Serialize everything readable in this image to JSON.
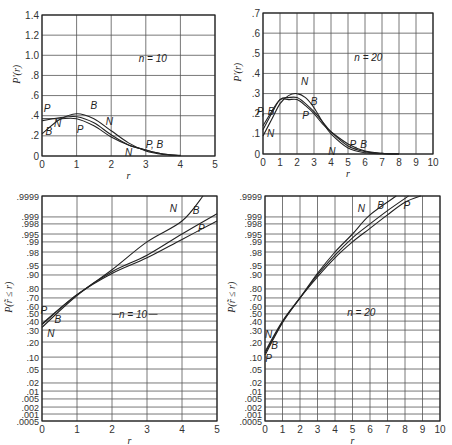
{
  "chart_data": [
    {
      "id": "pdf_n10",
      "type": "line",
      "title": "",
      "annotation": "n = 10",
      "xlabel": "r",
      "ylabel": "P'(r)",
      "xlim": [
        0,
        5
      ],
      "ylim": [
        0,
        1.4
      ],
      "xticks": [
        "0",
        "1",
        "2",
        "3",
        "4",
        "5"
      ],
      "yticks": [
        "0",
        ".2",
        ".4",
        ".6",
        ".8",
        "1.0",
        "1.2",
        "1.4"
      ],
      "grid": true,
      "frame": {
        "x0": 42,
        "x1": 215,
        "y0": 15,
        "y1": 156
      },
      "series": [
        {
          "name": "N",
          "x": [
            0,
            0.5,
            1.0,
            1.5,
            2.0,
            2.5,
            3.0,
            3.5,
            4.0
          ],
          "y": [
            0.22,
            0.36,
            0.42,
            0.37,
            0.25,
            0.13,
            0.05,
            0.015,
            0.003
          ]
        },
        {
          "name": "B",
          "x": [
            0,
            0.5,
            1.0,
            1.5,
            2.0,
            2.5,
            3.0,
            3.5,
            4.0
          ],
          "y": [
            0.35,
            0.38,
            0.39,
            0.33,
            0.21,
            0.11,
            0.06,
            0.02,
            0.005
          ]
        },
        {
          "name": "P",
          "x": [
            0,
            0.5,
            1.0,
            1.5,
            2.0,
            2.5,
            3.0,
            3.5,
            4.0
          ],
          "y": [
            0.37,
            0.37,
            0.37,
            0.3,
            0.19,
            0.11,
            0.06,
            0.02,
            0.006
          ]
        }
      ],
      "labels": [
        {
          "text": "P",
          "x": 0.15,
          "y": 0.47
        },
        {
          "text": "B",
          "x": 0.2,
          "y": 0.24
        },
        {
          "text": "N",
          "x": 0.45,
          "y": 0.32
        },
        {
          "text": "B",
          "x": 1.5,
          "y": 0.5
        },
        {
          "text": "P",
          "x": 1.1,
          "y": 0.26
        },
        {
          "text": "N",
          "x": 1.95,
          "y": 0.34
        },
        {
          "text": "N",
          "x": 2.5,
          "y": 0.03
        },
        {
          "text": "P, B",
          "x": 3.25,
          "y": 0.11
        }
      ]
    },
    {
      "id": "pdf_n20",
      "type": "line",
      "title": "",
      "annotation": "n = 20",
      "xlabel": "r",
      "ylabel": "P'(r)",
      "xlim": [
        0,
        10
      ],
      "ylim": [
        0,
        0.7
      ],
      "xticks": [
        "0",
        "1",
        "2",
        "3",
        "4",
        "5",
        "6",
        "7",
        "8",
        "9",
        "10"
      ],
      "yticks": [
        "0",
        ".1",
        ".2",
        ".3",
        ".4",
        ".5",
        ".6",
        ".7"
      ],
      "grid": true,
      "frame": {
        "x0": 263,
        "x1": 433,
        "y0": 13,
        "y1": 154
      },
      "series": [
        {
          "name": "N",
          "x": [
            0,
            0.5,
            1.0,
            1.5,
            2.0,
            2.5,
            3.0,
            3.5,
            4.0,
            5.0,
            6.0,
            7.0,
            8.0
          ],
          "y": [
            0.09,
            0.17,
            0.25,
            0.29,
            0.3,
            0.28,
            0.23,
            0.16,
            0.1,
            0.03,
            0.006,
            0.001,
            0.0
          ]
        },
        {
          "name": "B",
          "x": [
            0,
            0.5,
            1.0,
            1.5,
            2.0,
            2.5,
            3.0,
            3.5,
            4.0,
            5.0,
            6.0,
            7.0,
            8.0
          ],
          "y": [
            0.12,
            0.2,
            0.27,
            0.28,
            0.28,
            0.25,
            0.21,
            0.16,
            0.11,
            0.04,
            0.012,
            0.003,
            0.0
          ]
        },
        {
          "name": "P",
          "x": [
            0,
            0.5,
            1.0,
            1.5,
            2.0,
            2.5,
            3.0,
            3.5,
            4.0,
            5.0,
            6.0,
            7.0,
            8.0
          ],
          "y": [
            0.14,
            0.21,
            0.27,
            0.27,
            0.27,
            0.24,
            0.2,
            0.15,
            0.11,
            0.05,
            0.015,
            0.004,
            0.001
          ]
        }
      ],
      "labels": [
        {
          "text": "P, B",
          "x": 0.15,
          "y": 0.21
        },
        {
          "text": "N",
          "x": 0.45,
          "y": 0.1
        },
        {
          "text": "N",
          "x": 2.45,
          "y": 0.36
        },
        {
          "text": "B",
          "x": 3.0,
          "y": 0.26
        },
        {
          "text": "P",
          "x": 2.5,
          "y": 0.19
        },
        {
          "text": "N",
          "x": 4.05,
          "y": 0.01
        },
        {
          "text": "P, B",
          "x": 5.6,
          "y": 0.045
        }
      ]
    },
    {
      "id": "cdf_n10",
      "type": "line",
      "title": "",
      "annotation": "n = 10",
      "xlabel": "r",
      "ylabel": "P(r̃ ≤ r)",
      "xlim": [
        0,
        5
      ],
      "yscale": "probability",
      "xticks": [
        "0",
        "1",
        "2",
        "3",
        "4",
        "5"
      ],
      "yticks": [
        ".0005",
        ".001",
        ".002",
        ".005",
        ".01",
        ".02",
        ".05",
        ".10",
        ".20",
        ".30",
        ".40",
        ".50",
        ".60",
        ".70",
        ".80",
        ".90",
        ".95",
        ".98",
        ".99",
        ".995",
        ".998",
        ".999",
        ".9999"
      ],
      "grid": true,
      "frame": {
        "x0": 42,
        "x1": 217,
        "y0": 196,
        "y1": 421
      },
      "series": [
        {
          "name": "N",
          "x": [
            0,
            1,
            2,
            3,
            4,
            4.6
          ],
          "y": [
            0.33,
            0.73,
            0.93,
            0.99,
            0.9985,
            0.9999
          ]
        },
        {
          "name": "B",
          "x": [
            0,
            1,
            2,
            3,
            4,
            5
          ],
          "y": [
            0.36,
            0.74,
            0.92,
            0.975,
            0.995,
            0.9993
          ]
        },
        {
          "name": "P",
          "x": [
            0,
            1,
            2,
            3,
            4,
            5
          ],
          "y": [
            0.37,
            0.74,
            0.91,
            0.97,
            0.992,
            0.9985
          ]
        }
      ],
      "labels": [
        {
          "text": "N",
          "x": 3.75,
          "y": 0.9996
        },
        {
          "text": "B",
          "x": 4.4,
          "y": 0.9995
        },
        {
          "text": "P",
          "x": 4.55,
          "y": 0.997
        },
        {
          "text": "P",
          "x": 0.05,
          "y": 0.55
        },
        {
          "text": "B",
          "x": 0.45,
          "y": 0.42
        },
        {
          "text": "N",
          "x": 0.25,
          "y": 0.27
        }
      ]
    },
    {
      "id": "cdf_n20",
      "type": "line",
      "title": "",
      "annotation": "n = 20",
      "xlabel": "r",
      "ylabel": "P(r̃ ≤ r)",
      "xlim": [
        0,
        10
      ],
      "yscale": "probability",
      "xticks": [
        "0",
        "1",
        "2",
        "3",
        "4",
        "5",
        "6",
        "7",
        "8",
        "9",
        "10"
      ],
      "yticks": [
        ".0005",
        ".001",
        ".002",
        ".005",
        ".01",
        ".02",
        ".05",
        ".10",
        ".20",
        ".30",
        ".40",
        ".50",
        ".60",
        ".70",
        ".80",
        ".90",
        ".95",
        ".98",
        ".99",
        ".995",
        ".998",
        ".999",
        ".9999"
      ],
      "grid": true,
      "frame": {
        "x0": 265,
        "x1": 440,
        "y0": 196,
        "y1": 421
      },
      "series": [
        {
          "name": "N",
          "x": [
            0,
            1,
            2,
            3,
            4,
            5,
            6,
            7.5
          ],
          "y": [
            0.11,
            0.38,
            0.7,
            0.91,
            0.98,
            0.995,
            0.9992,
            0.9999
          ]
        },
        {
          "name": "B",
          "x": [
            0,
            1,
            2,
            3,
            4,
            5,
            6,
            7,
            8.2
          ],
          "y": [
            0.12,
            0.39,
            0.7,
            0.9,
            0.975,
            0.993,
            0.998,
            0.9995,
            0.9999
          ]
        },
        {
          "name": "P",
          "x": [
            0,
            1,
            2,
            3,
            4,
            5,
            6,
            7,
            8,
            8.9
          ],
          "y": [
            0.13,
            0.4,
            0.7,
            0.89,
            0.97,
            0.99,
            0.997,
            0.9992,
            0.9998,
            0.9999
          ]
        }
      ],
      "labels": [
        {
          "text": "N",
          "x": 5.5,
          "y": 0.9996
        },
        {
          "text": "B",
          "x": 6.6,
          "y": 0.9997
        },
        {
          "text": "P",
          "x": 8.1,
          "y": 0.9997
        },
        {
          "text": "N",
          "x": 0.2,
          "y": 0.26
        },
        {
          "text": "B",
          "x": 0.55,
          "y": 0.17
        },
        {
          "text": "P",
          "x": 0.2,
          "y": 0.095
        }
      ]
    }
  ],
  "prob_scale_pixels": {
    "comment_free_mapping_by_tick": [
      [
        ".9999",
        0.0
      ],
      [
        ".999",
        0.093
      ],
      [
        ".998",
        0.124
      ],
      [
        ".995",
        0.169
      ],
      [
        ".99",
        0.204
      ],
      [
        ".98",
        0.249
      ],
      [
        ".95",
        0.307
      ],
      [
        ".90",
        0.351
      ],
      [
        ".80",
        0.413
      ],
      [
        ".70",
        0.453
      ],
      [
        ".60",
        0.489
      ],
      [
        ".50",
        0.524
      ],
      [
        ".40",
        0.556
      ],
      [
        ".30",
        0.596
      ],
      [
        ".20",
        0.649
      ],
      [
        ".10",
        0.716
      ],
      [
        ".05",
        0.769
      ],
      [
        ".02",
        0.831
      ],
      [
        ".01",
        0.867
      ],
      [
        ".005",
        0.902
      ],
      [
        ".002",
        0.938
      ],
      [
        ".001",
        0.969
      ],
      [
        ".0005",
        1.0
      ]
    ]
  }
}
